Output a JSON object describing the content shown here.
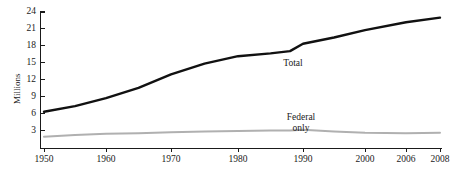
{
  "chart_data": {
    "type": "line",
    "title": "",
    "subtitle": "",
    "xlabel": "",
    "ylabel": "Millions",
    "grid": false,
    "legend_position": "inline-annotations",
    "xlim": [
      1950,
      2008
    ],
    "ylim": [
      0,
      24
    ],
    "yticks": [
      3,
      6,
      9,
      12,
      15,
      18,
      21,
      24
    ],
    "ytick_labels": [
      "3",
      "6",
      "9",
      "12",
      "15",
      "18",
      "21",
      "24"
    ],
    "xticks": [
      1950,
      1960,
      1970,
      1980,
      1990,
      2000,
      2006,
      2008
    ],
    "xtick_labels": [
      "1950",
      "1960",
      "1970",
      "1980",
      "1990",
      "2000",
      "2006",
      "2008"
    ],
    "x": [
      1950,
      1955,
      1960,
      1965,
      1970,
      1975,
      1980,
      1985,
      1988,
      1990,
      1995,
      2000,
      2006,
      2008
    ],
    "series": [
      {
        "name": "Total",
        "color": "#111111",
        "width": 2.4,
        "annotation": "Total",
        "values": [
          6.4,
          7.4,
          8.8,
          10.6,
          13.0,
          14.9,
          16.2,
          16.7,
          17.1,
          18.4,
          19.5,
          20.8,
          22.2,
          23.0
        ]
      },
      {
        "name": "Federal only",
        "color": "#b0b0b0",
        "width": 2.0,
        "annotation_line1": "Federal",
        "annotation_line2": "only",
        "values": [
          2.0,
          2.3,
          2.5,
          2.6,
          2.8,
          2.9,
          3.0,
          3.1,
          3.1,
          3.2,
          2.9,
          2.7,
          2.6,
          2.7
        ]
      }
    ],
    "annotations": [
      {
        "text": "Total",
        "series": "Total",
        "x_px": 293,
        "y_px": 63
      },
      {
        "text": "Federal only",
        "series": "Federal only",
        "x_px": 301,
        "y_px": 118
      }
    ],
    "axis_color": "#1a1a1a",
    "background": "#ffffff"
  },
  "geometry": {
    "plot_left": 40,
    "plot_right": 441,
    "plot_bottom": 148,
    "plot_top": 12,
    "y_zero_px": 148,
    "y_per_unit_px": 5.6667,
    "xtick_px": [
      44,
      106,
      171,
      238,
      303,
      365,
      406,
      440
    ]
  }
}
